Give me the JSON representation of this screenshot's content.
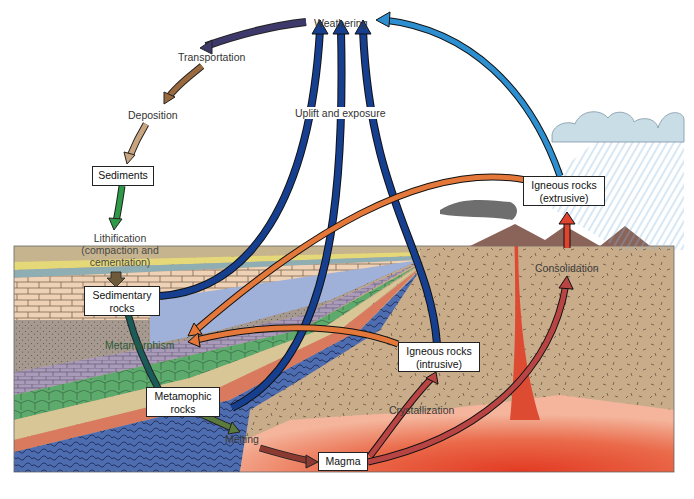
{
  "process_labels": {
    "weathering": "Weathering",
    "transportation": "Transportation",
    "deposition": "Deposition",
    "lithification_1": "Lithification",
    "lithification_2": "(compaction and",
    "lithification_3": "cementation)",
    "uplift": "Uplift and exposure",
    "metamorphism": "Metamorphism",
    "melting": "Melting",
    "crystallization": "Crystallization",
    "consolidation": "Consolidation"
  },
  "boxes": {
    "sediments": "Sediments",
    "sedimentary_1": "Sedimentary",
    "sedimentary_2": "rocks",
    "metamorphic_1": "Metamophic",
    "metamorphic_2": "rocks",
    "magma": "Magma",
    "igneous_intrusive_1": "Igneous rocks",
    "igneous_intrusive_2": "(intrusive)",
    "igneous_extrusive_1": "Igneous rocks",
    "igneous_extrusive_2": "(extrusive)"
  },
  "colors": {
    "weathering_arrow": "#3d3a6b",
    "transportation_arrow": "#9a6a3e",
    "deposition_arrow": "#c9a57f",
    "lithification_arrow": "#2e9a48",
    "uplift_arrow": "#163f8f",
    "extrusive_weathering_arrow": "#2d8fd0",
    "metamorphism_arrow": "#e4773a",
    "magma_arrow": "#b94444",
    "ground": "#c9ad8b",
    "magma": "#e64a2e",
    "metamorphic_blue": "#4e6db0",
    "volcano": "#8a6359"
  }
}
